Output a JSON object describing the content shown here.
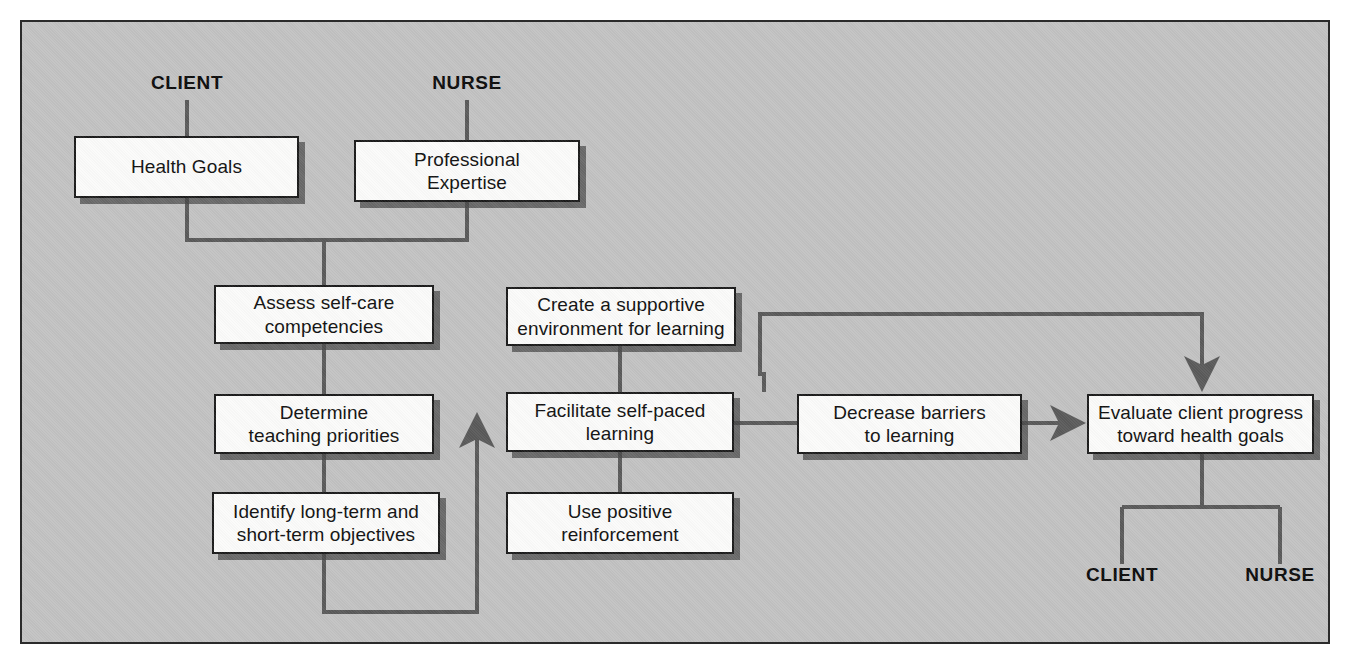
{
  "diagram": {
    "panel_bg": "#c2c2c2",
    "node_fill": "#fbfbfa",
    "line_color": "#5a5a5a",
    "border_color": "#1b1b1b",
    "roles_top": [
      {
        "id": "role-top-client",
        "label": "CLIENT"
      },
      {
        "id": "role-top-nurse",
        "label": "NURSE"
      }
    ],
    "roles_bottom": [
      {
        "id": "role-bottom-client",
        "label": "CLIENT"
      },
      {
        "id": "role-bottom-nurse",
        "label": "NURSE"
      }
    ],
    "nodes": [
      {
        "id": "health-goals",
        "line1": "Health Goals",
        "line2": ""
      },
      {
        "id": "professional-expertise",
        "line1": "Professional",
        "line2": "Expertise"
      },
      {
        "id": "assess-self-care",
        "line1": "Assess self-care",
        "line2": "competencies"
      },
      {
        "id": "determine-teaching",
        "line1": "Determine",
        "line2": "teaching priorities"
      },
      {
        "id": "identify-objectives",
        "line1": "Identify long-term and",
        "line2": "short-term objectives"
      },
      {
        "id": "create-supportive",
        "line1": "Create a supportive",
        "line2": "environment for learning"
      },
      {
        "id": "facilitate-learning",
        "line1": "Facilitate self-paced",
        "line2": "learning"
      },
      {
        "id": "use-positive",
        "line1": "Use positive",
        "line2": "reinforcement"
      },
      {
        "id": "decrease-barriers",
        "line1": "Decrease barriers",
        "line2": "to learning"
      },
      {
        "id": "evaluate-progress",
        "line1": "Evaluate client progress",
        "line2": "toward health goals"
      }
    ]
  }
}
